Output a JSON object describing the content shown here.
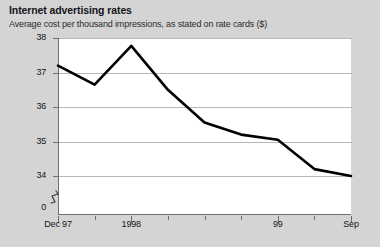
{
  "header": {
    "title": "Internet advertising rates",
    "subtitle": "Average cost per thousand impressions, as stated on rate cards ($)"
  },
  "chart_data": {
    "type": "line",
    "title": "Internet advertising rates",
    "subtitle": "Average cost per thousand impressions, as stated on rate cards ($)",
    "xlabel": "",
    "ylabel": "",
    "ylim": [
      34,
      38
    ],
    "y_axis_broken_at_zero": true,
    "y_zero_label": "0",
    "yticks": [
      38,
      37,
      36,
      35,
      34
    ],
    "ytick_labels": [
      "38",
      "37",
      "36",
      "35",
      "34"
    ],
    "grid": true,
    "legend": false,
    "x_tick_count": 9,
    "xtick_labels": [
      "Dec 97",
      "1998",
      "99",
      "Sep"
    ],
    "xtick_label_positions": [
      0,
      2,
      6,
      8
    ],
    "x": [
      "Dec 97",
      "Mar 98",
      "Jun 98",
      "Sep 98",
      "Dec 98",
      "Mar 99",
      "Jun 99",
      "Aug 99",
      "Sep 99"
    ],
    "values": [
      37.2,
      36.65,
      37.77,
      36.5,
      35.55,
      35.2,
      35.05,
      34.2,
      34.0
    ],
    "line_color": "#000000",
    "line_width": 2.6,
    "background_color": "#d4d4d4",
    "plot_background_color": "#ffffff",
    "gridline_color": "#b9b9b9",
    "axis_color": "#6e6e6e"
  }
}
